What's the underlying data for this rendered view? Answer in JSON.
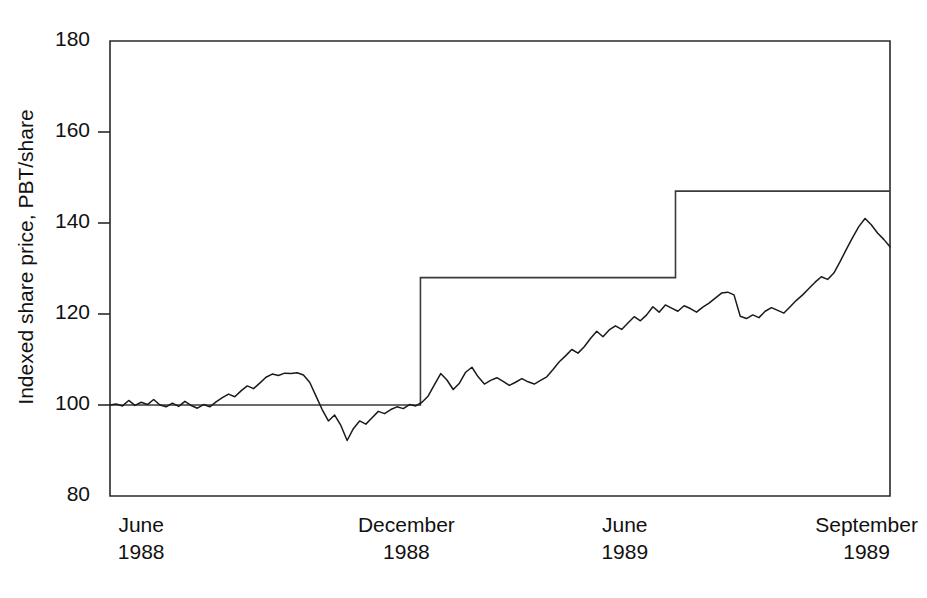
{
  "chart_data": {
    "type": "line",
    "title": "",
    "xlabel": "",
    "ylabel": "Indexed share price, PBT/share",
    "ylim": [
      80,
      180
    ],
    "yticks": [
      80,
      100,
      120,
      140,
      160,
      180
    ],
    "ytick_labels": [
      "80",
      "100",
      "120",
      "140",
      "160",
      "180"
    ],
    "xtick_labels": [
      {
        "month": "June",
        "year": "1988"
      },
      {
        "month": "December",
        "year": "1988"
      },
      {
        "month": "June",
        "year": "1989"
      },
      {
        "month": "September",
        "year": "1989"
      }
    ],
    "xtick_positions_frac": [
      0.04,
      0.38,
      0.66,
      0.97
    ],
    "grid": false,
    "legend": false,
    "series": [
      {
        "name": "Indexed share price",
        "style": "solid-thin",
        "color": "#1a1a1a",
        "x": [
          0.0,
          0.008,
          0.016,
          0.024,
          0.032,
          0.04,
          0.048,
          0.056,
          0.064,
          0.072,
          0.08,
          0.088,
          0.096,
          0.104,
          0.112,
          0.12,
          0.128,
          0.136,
          0.144,
          0.152,
          0.16,
          0.168,
          0.176,
          0.184,
          0.192,
          0.2,
          0.208,
          0.216,
          0.224,
          0.232,
          0.24,
          0.248,
          0.256,
          0.264,
          0.272,
          0.28,
          0.288,
          0.296,
          0.304,
          0.312,
          0.32,
          0.328,
          0.336,
          0.344,
          0.352,
          0.36,
          0.368,
          0.376,
          0.384,
          0.392,
          0.4,
          0.408,
          0.416,
          0.424,
          0.432,
          0.44,
          0.448,
          0.456,
          0.464,
          0.472,
          0.48,
          0.488,
          0.496,
          0.504,
          0.512,
          0.52,
          0.528,
          0.536,
          0.544,
          0.552,
          0.56,
          0.568,
          0.576,
          0.584,
          0.592,
          0.6,
          0.608,
          0.616,
          0.624,
          0.632,
          0.64,
          0.648,
          0.656,
          0.664,
          0.672,
          0.68,
          0.688,
          0.696,
          0.704,
          0.712,
          0.72,
          0.728,
          0.736,
          0.744,
          0.752,
          0.76,
          0.768,
          0.776,
          0.784,
          0.792,
          0.8,
          0.808,
          0.816,
          0.824,
          0.832,
          0.84,
          0.848,
          0.856,
          0.864,
          0.872,
          0.88,
          0.888,
          0.896,
          0.904,
          0.912,
          0.92,
          0.928,
          0.936,
          0.944,
          0.952,
          0.96,
          0.968,
          0.976,
          0.984,
          0.992,
          1.0
        ],
        "y": [
          100.0,
          100.2,
          99.8,
          101.0,
          99.9,
          100.6,
          100.1,
          101.2,
          100.0,
          99.6,
          100.4,
          99.7,
          100.8,
          99.9,
          99.3,
          100.1,
          99.6,
          100.7,
          101.6,
          102.4,
          101.8,
          103.1,
          104.2,
          103.6,
          104.8,
          106.1,
          106.8,
          106.5,
          107.0,
          106.9,
          107.1,
          106.6,
          105.0,
          102.0,
          99.0,
          96.5,
          97.8,
          95.5,
          92.2,
          94.8,
          96.5,
          95.8,
          97.2,
          98.6,
          98.1,
          99.0,
          99.6,
          99.2,
          100.1,
          99.8,
          100.6,
          102.0,
          104.5,
          106.9,
          105.5,
          103.4,
          104.8,
          107.2,
          108.3,
          106.2,
          104.6,
          105.4,
          106.0,
          105.2,
          104.3,
          105.0,
          105.8,
          105.1,
          104.6,
          105.4,
          106.2,
          107.8,
          109.5,
          110.8,
          112.2,
          111.4,
          112.8,
          114.6,
          116.2,
          115.0,
          116.5,
          117.4,
          116.6,
          118.0,
          119.4,
          118.5,
          119.8,
          121.6,
          120.4,
          122.0,
          121.3,
          120.6,
          121.8,
          121.2,
          120.4,
          121.5,
          122.4,
          123.5,
          124.6,
          124.8,
          124.2,
          119.5,
          119.0,
          119.8,
          119.2,
          120.6,
          121.4,
          120.8,
          120.2,
          121.6,
          123.0,
          124.2,
          125.6,
          127.0,
          128.2,
          127.6,
          129.0,
          131.5,
          134.2,
          136.8,
          139.2,
          141.0,
          139.6,
          137.8,
          136.4,
          134.8
        ]
      },
      {
        "name": "Indexed share price (cont.)",
        "style": "solid-thin",
        "color": "#1a1a1a",
        "x": [],
        "y": []
      }
    ],
    "step_series": {
      "name": "Indexed PBT/share (step)",
      "color": "#3a3a3a",
      "steps": [
        {
          "x_start_frac": 0.0,
          "x_end_frac": 0.398,
          "value": 100
        },
        {
          "x_start_frac": 0.398,
          "x_end_frac": 0.725,
          "value": 128
        },
        {
          "x_start_frac": 0.725,
          "x_end_frac": 1.0,
          "value": 147
        }
      ]
    },
    "annotations": []
  },
  "plot_geometry": {
    "left_px": 110,
    "right_px": 890,
    "top_px": 41,
    "bottom_px": 496
  }
}
